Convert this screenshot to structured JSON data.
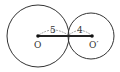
{
  "diagram": {
    "type": "tangent-circles",
    "colors": {
      "stroke": "#333333",
      "background": "#ffffff"
    },
    "circle_o": {
      "label": "O",
      "radius_label": "5",
      "cx": 38,
      "cy": 36,
      "r": 32
    },
    "circle_o_prime": {
      "label": "O′",
      "radius_label": "4",
      "cx": 92,
      "cy": 36,
      "r": 24
    }
  }
}
